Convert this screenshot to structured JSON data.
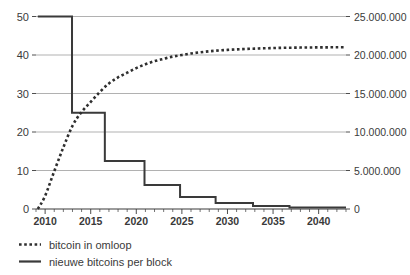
{
  "chart_data": {
    "type": "line",
    "title": "",
    "subtitle": "",
    "xlabel": "",
    "ylabel": "",
    "ylabel_right": "",
    "grid": true,
    "legend_position": "below",
    "xlim": [
      2009,
      2043
    ],
    "x_ticks_major": [
      2010,
      2015,
      2020,
      2025,
      2030,
      2035,
      2040
    ],
    "x_tick_labels": [
      "2010",
      "2015",
      "2020",
      "2025",
      "2030",
      "2035",
      "2040"
    ],
    "x_ticks_minor_step": 1,
    "ylim_left": [
      0,
      50
    ],
    "y_ticks_left": [
      0,
      10,
      20,
      30,
      40,
      50
    ],
    "y_tick_labels_left": [
      "0",
      "10",
      "20",
      "30",
      "40",
      "50"
    ],
    "ylim_right": [
      0,
      25000000
    ],
    "y_ticks_right": [
      0,
      5000000,
      10000000,
      15000000,
      20000000,
      25000000
    ],
    "y_tick_labels_right": [
      "0",
      "5.000.000",
      "10.000.000",
      "15.000.000",
      "20.000.000",
      "25.000.000"
    ],
    "series": [
      {
        "name": "bitcoin in omloop",
        "style": "dotted",
        "axis": "right",
        "x": [
          2009.2,
          2010,
          2011,
          2012,
          2013,
          2014,
          2015,
          2016,
          2017,
          2018,
          2019,
          2020,
          2021,
          2022,
          2023,
          2024,
          2025,
          2026,
          2027,
          2028,
          2029,
          2030,
          2031,
          2032,
          2033,
          2034,
          2035,
          2036,
          2037,
          2038,
          2039,
          2040,
          2041,
          2042,
          2043
        ],
        "values": [
          0,
          1700000,
          4900000,
          8000000,
          10800000,
          12600000,
          13900000,
          15200000,
          16300000,
          17100000,
          17700000,
          18300000,
          18800000,
          19200000,
          19500000,
          19800000,
          20000000,
          20200000,
          20350000,
          20480000,
          20580000,
          20660000,
          20730000,
          20790000,
          20830000,
          20870000,
          20900000,
          20930000,
          20950000,
          20965000,
          20978000,
          20988000,
          20995000,
          21000000,
          21000000
        ]
      },
      {
        "name": "nieuwe bitcoins per block",
        "style": "solid-step",
        "axis": "left",
        "steps": [
          {
            "from": 2009.2,
            "to": 2012.95,
            "value": 50
          },
          {
            "from": 2012.95,
            "to": 2016.55,
            "value": 25
          },
          {
            "from": 2016.55,
            "to": 2020.9,
            "value": 12.5
          },
          {
            "from": 2020.9,
            "to": 2024.8,
            "value": 6.25
          },
          {
            "from": 2024.8,
            "to": 2028.7,
            "value": 3.125
          },
          {
            "from": 2028.7,
            "to": 2032.8,
            "value": 1.5625
          },
          {
            "from": 2032.8,
            "to": 2036.8,
            "value": 0.78125
          },
          {
            "from": 2036.8,
            "to": 2043,
            "value": 0.39
          }
        ]
      }
    ],
    "legend": [
      {
        "label": "bitcoin in omloop",
        "marker": "dotted-line"
      },
      {
        "label": "nieuwe bitcoins per block",
        "marker": "solid-line"
      }
    ],
    "colors": {
      "line": "#3a3a3a",
      "gridline": "#a8a8a8",
      "text": "#3a3a3a",
      "background": "#ffffff"
    }
  }
}
